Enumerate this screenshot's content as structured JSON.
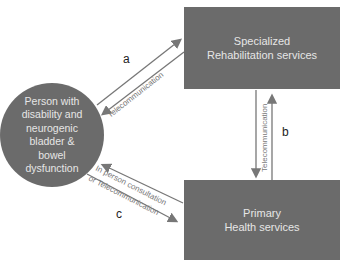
{
  "nodes": {
    "person": {
      "line1": "Person with",
      "line2": "disability and",
      "line3": "neurogenic",
      "line4": "bladder  &",
      "line5": "bowel",
      "line6": "dysfunction"
    },
    "specialized": {
      "line1": "Specialized",
      "line2": "Rehabilitation services"
    },
    "primary": {
      "line1": "Primary",
      "line2": "Health services"
    }
  },
  "edges": {
    "a": {
      "label": "a",
      "text": "Telecommunication"
    },
    "b": {
      "label": "b",
      "text": "Telecommunication"
    },
    "c": {
      "label": "c",
      "text1": "In person consultation",
      "text2": "or Telecommunication"
    }
  },
  "colors": {
    "node_fill": "#6b6b6b",
    "node_text": "#e6e6e6",
    "arrow": "#777777"
  }
}
